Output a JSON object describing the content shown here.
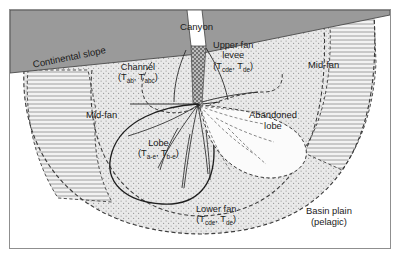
{
  "figure": {
    "kind": "submarine-fan-depositional-model-diagram",
    "frame": {
      "border_color": "#8f8f8f",
      "background": "#ffffff"
    }
  },
  "palette": {
    "slope_fill": "#9a9a9a",
    "slope_edge": "#4a4a4a",
    "fan_stipple_fill": "#e4e4e4",
    "fan_stipple_dot": "#9b9b9b",
    "feeder_channel_fill": "#8a8a8a",
    "canyon_fill": "#ffffff",
    "hatch_line": "#8a8a8a",
    "dashed_boundary": "#3c3c3c",
    "lobe_outline": "#1f1f1f",
    "channel_line": "#2b2b2b",
    "text": "#1b1b1b",
    "basin_plain_fill": "#ffffff"
  },
  "labels": {
    "canyon": {
      "text": "Canyon",
      "x": 192,
      "y": 22,
      "size": 9.6,
      "rotate": 0
    },
    "continental_slope": {
      "text": "Continental slope",
      "x": 24,
      "y": 63,
      "size": 9.6,
      "rotate": -11.5
    },
    "channel": {
      "line1": "Channel",
      "sub_prefix": "(T",
      "sub_a": "ab",
      "mid": ", T",
      "sub_b": "abc",
      "suffix": ")",
      "x": 140,
      "y": 66,
      "size": 9.2
    },
    "upper_fan_levee": {
      "line1": "Upper fan",
      "line2": "levee",
      "sub_prefix": "(T",
      "sub_a": "cde",
      "mid": ", T",
      "sub_b": "de",
      "suffix": ")",
      "x": 239,
      "y": 44,
      "size": 9.2
    },
    "mid_fan_left": {
      "text": "Mid-fan",
      "x": 99,
      "y": 107,
      "size": 9.4
    },
    "mid_fan_right": {
      "text": "Mid-fan",
      "x": 320,
      "y": 58,
      "size": 9.4
    },
    "lobe": {
      "line1": "Lobe",
      "sub_prefix": "(T",
      "sub_a": "a-e",
      "mid": ", T",
      "sub_b": "b-e",
      "suffix": ")",
      "x": 152,
      "y": 141,
      "size": 9.2
    },
    "abandoned_lobe": {
      "line1": "Abandoned",
      "line2": "lobe",
      "x": 275,
      "y": 114,
      "size": 9.4
    },
    "lower_fan": {
      "line1": "Lower fan",
      "sub_prefix": "(T",
      "sub_a": "cde",
      "mid": ", T",
      "sub_b": "de",
      "suffix": ")",
      "x": 223,
      "y": 208,
      "size": 9.2
    },
    "basin_plain": {
      "line1": "Basin plain",
      "line2": "(pelagic)",
      "x": 333,
      "y": 210,
      "size": 9.4
    }
  },
  "geometry": {
    "slope_polygon": "10,10 392,10 392,14 196,52 10,72",
    "canyon_polygon": "186,10 200,10 204,44 197,46 190,44",
    "feeder_channel_polygon": "190,44 204,44 200,100 196,103 191,100",
    "fan_outer_arc": "M 24,70 C 20,150 70,230 200,232 C 330,230 380,150 372,14",
    "fan_inner_dashed": "M 92,70 C 84,150 120,212 200,214 C 286,212 330,150 324,24",
    "apex": {
      "x": 196,
      "y": 101
    },
    "lobe_outline": "M 196,102 C 160,104 120,118 110,150 C 100,182 126,200 160,202 C 196,204 212,182 212,150 C 212,124 206,108 196,102 Z",
    "abandoned_lobe_outline": "M 198,103 C 232,106 276,112 296,132 C 314,152 302,174 270,176 C 236,176 212,152 204,126 C 200,114 198,106 198,103 Z",
    "lobe_channels": [
      "M 196,103 C 176,116 152,126 126,134",
      "M 196,103 C 180,124 166,146 156,166",
      "M 196,103 C 190,128 186,156 182,186",
      "M 196,103 C 200,126 204,150 206,172",
      "M 196,103 C 204,120 212,134 216,146",
      "M 176,126 C 168,140 162,154 158,168",
      "M 188,132 C 184,152 182,170 180,186"
    ],
    "abandoned_channels": [
      "M 198,104 C 218,112 240,118 262,122",
      "M 198,104 C 216,124 234,140 252,152",
      "M 198,104 C 206,128 216,150 228,168",
      "M 198,104 C 228,108 256,110 282,112",
      "M 226,126 C 240,140 252,152 264,162"
    ],
    "levee_lines": [
      "M 204,46 C 214,62 222,78 226,96",
      "M 200,100 C 214,96 234,92 256,90"
    ],
    "hatch_wedges": [
      "M 28,70 L 88,70 L 96,110 C 92,150 100,178 112,200 L 58,196 C 36,162 24,118 28,70 Z",
      "M 330,24 L 372,14 L 374,60 C 372,104 360,140 340,168 L 300,150 C 320,122 330,80 330,24 Z"
    ]
  }
}
